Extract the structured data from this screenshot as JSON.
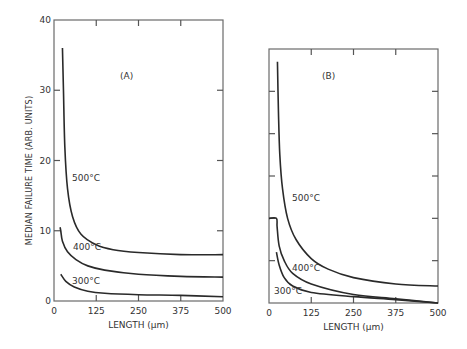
{
  "chart_data": [
    {
      "type": "line",
      "panel_label": "(A)",
      "title": "",
      "xlabel": "LENGTH (μm)",
      "ylabel": "MEDIAN FAILURE TIME (ARB. UNITS)",
      "xlim": [
        0,
        500
      ],
      "ylim": [
        0,
        40
      ],
      "x_ticks": [
        "0",
        "125",
        "250",
        "375",
        "500"
      ],
      "y_ticks": [
        "0",
        "10",
        "20",
        "30",
        "40"
      ],
      "grid": false,
      "series": [
        {
          "name": "500°C",
          "x": [
            25,
            28,
            32,
            40,
            55,
            80,
            125,
            175,
            250,
            375,
            500
          ],
          "y": [
            36,
            30,
            22,
            16,
            12,
            9.5,
            8.0,
            7.3,
            6.9,
            6.6,
            6.6
          ]
        },
        {
          "name": "400°C",
          "x": [
            18,
            20,
            25,
            40,
            65,
            100,
            150,
            250,
            375,
            500
          ],
          "y": [
            10.5,
            10.0,
            8.5,
            7.0,
            5.9,
            5.0,
            4.4,
            3.8,
            3.5,
            3.4
          ]
        },
        {
          "name": "300°C",
          "x": [
            20,
            35,
            60,
            100,
            150,
            250,
            375,
            500
          ],
          "y": [
            3.8,
            2.8,
            2.0,
            1.4,
            1.1,
            0.9,
            0.8,
            0.6
          ]
        }
      ],
      "annotations": [
        "500°C",
        "400°C",
        "300°C"
      ]
    },
    {
      "type": "line",
      "panel_label": "(B)",
      "title": "",
      "xlabel": "LENGTH (μm)",
      "ylabel": "",
      "xlim": [
        0,
        500
      ],
      "ylim": [
        0,
        6
      ],
      "x_ticks": [
        "0",
        "125",
        "250",
        "375",
        "500"
      ],
      "y_ticks": [],
      "grid": false,
      "series": [
        {
          "name": "500°C",
          "x": [
            25,
            28,
            32,
            40,
            55,
            80,
            125,
            175,
            250,
            375,
            500
          ],
          "y": [
            5.7,
            4.5,
            3.5,
            2.7,
            2.0,
            1.5,
            1.05,
            0.8,
            0.6,
            0.45,
            0.4
          ]
        },
        {
          "name": "400°C",
          "x": [
            0,
            22,
            24,
            30,
            45,
            70,
            125,
            250,
            375,
            500
          ],
          "y": [
            2.0,
            2.0,
            1.8,
            1.35,
            1.0,
            0.7,
            0.45,
            0.2,
            0.1,
            0.0
          ]
        },
        {
          "name": "300°C",
          "x": [
            22,
            30,
            45,
            70,
            125,
            250,
            375,
            500
          ],
          "y": [
            1.2,
            0.9,
            0.6,
            0.4,
            0.25,
            0.15,
            0.08,
            0.0
          ]
        }
      ],
      "annotations": [
        "500°C",
        "400°C",
        "300°C"
      ]
    }
  ],
  "panels": [
    {
      "id": "A",
      "label": "(A)",
      "box": {
        "x0": 54,
        "x1": 223,
        "y0": 301,
        "y1": 20
      },
      "ymax": 40,
      "y_tick_labels": [
        "0",
        "10",
        "20",
        "30",
        "40"
      ],
      "x_tick_labels": [
        "0",
        "125",
        "250",
        "375",
        "500"
      ],
      "xlabel": "LENGTH (μm)",
      "ylabel": "MEDIAN FAILURE TIME (ARB. UNITS)",
      "curve_labels": [
        {
          "text": "500°C",
          "x": 72,
          "y": 181
        },
        {
          "text": "400°C",
          "x": 73,
          "y": 250
        },
        {
          "text": "300°C",
          "x": 72,
          "y": 284
        }
      ]
    },
    {
      "id": "B",
      "label": "(B)",
      "box": {
        "x0": 269,
        "x1": 438,
        "y0": 303,
        "y1": 49
      },
      "ymax": 6,
      "y_tick_labels": [],
      "x_tick_labels": [
        "0",
        "125",
        "250",
        "375",
        "500"
      ],
      "xlabel": "LENGTH (μm)",
      "ylabel": "",
      "curve_labels": [
        {
          "text": "500°C",
          "x": 292,
          "y": 201
        },
        {
          "text": "400°C",
          "x": 292,
          "y": 271
        },
        {
          "text": "300°C",
          "x": 274,
          "y": 294
        }
      ]
    }
  ]
}
